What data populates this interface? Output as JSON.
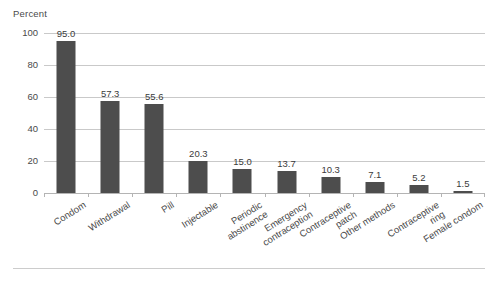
{
  "chart_data": {
    "type": "bar",
    "title": "",
    "subtitle": "",
    "xlabel": "",
    "ylabel": "Percent",
    "ylim": [
      0,
      100
    ],
    "yticks": [
      0,
      20,
      40,
      60,
      80,
      100
    ],
    "ytick_labels": [
      "0",
      "20",
      "40",
      "60",
      "80",
      "100"
    ],
    "grid": true,
    "legend": false,
    "legend_position": "none",
    "bar_color": "#4d4d4d",
    "gridline_color": "#c9c9c9",
    "categories": [
      "Condom",
      "Withdrawal",
      "Pill",
      "Injectable",
      "Periodic abstinence",
      "Emergency contraception",
      "Contraceptive patch",
      "Other methods",
      "Contraceptive ring",
      "Female condom"
    ],
    "category_lines": [
      [
        "Condom",
        ""
      ],
      [
        "Withdrawal",
        ""
      ],
      [
        "Pill",
        ""
      ],
      [
        "Injectable",
        ""
      ],
      [
        "Periodic",
        "abstinence"
      ],
      [
        "Emergency",
        "contraception"
      ],
      [
        "Contraceptive",
        "patch"
      ],
      [
        "Other methods",
        ""
      ],
      [
        "Contraceptive",
        "ring"
      ],
      [
        "Female condom",
        ""
      ]
    ],
    "values": [
      95.0,
      57.3,
      55.6,
      20.3,
      15.0,
      13.7,
      10.3,
      7.1,
      5.2,
      1.5
    ],
    "value_labels": [
      "95.0",
      "57.3",
      "55.6",
      "20.3",
      "15.0",
      "13.7",
      "10.3",
      "7.1",
      "5.2",
      "1.5"
    ]
  }
}
